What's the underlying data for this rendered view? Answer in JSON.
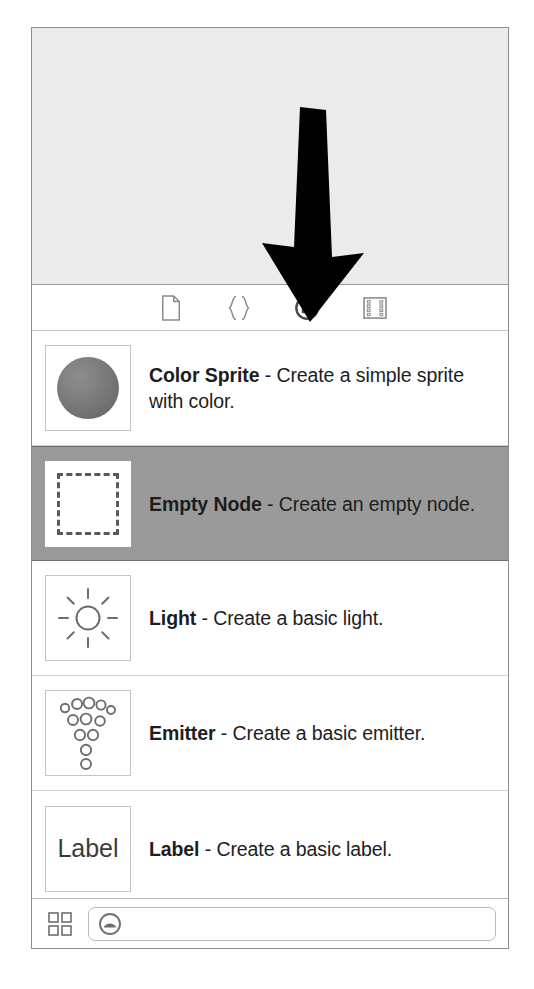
{
  "window": {
    "background_color": "#ffffff",
    "panel_border_color": "#8d8d8d"
  },
  "preview": {
    "name": "empty-preview-canvas",
    "background_color": "#ebebeb",
    "annotation": {
      "type": "arrow",
      "direction": "down",
      "color": "#000000",
      "points_to": "object-library-tab"
    }
  },
  "tabs": {
    "selected_index": 2,
    "items": [
      {
        "icon": "file-icon",
        "name": "tab-file",
        "label": ""
      },
      {
        "icon": "braces-icon",
        "name": "tab-code",
        "label": ""
      },
      {
        "icon": "object-icon",
        "name": "tab-objects",
        "label": ""
      },
      {
        "icon": "film-strip-icon",
        "name": "tab-media",
        "label": ""
      }
    ]
  },
  "node_list": {
    "selected_index": 1,
    "items": [
      {
        "title": "Color Sprite",
        "separator": " - ",
        "description": "Create a simple sprite with color.",
        "icon": "sphere-icon",
        "selected": false
      },
      {
        "title": "Empty Node",
        "separator": " - ",
        "description": "Create an empty node.",
        "icon": "dashed-square-icon",
        "selected": true
      },
      {
        "title": "Light",
        "separator": " - ",
        "description": "Create a basic light.",
        "icon": "light-icon",
        "selected": false
      },
      {
        "title": "Emitter",
        "separator": " - ",
        "description": "Create a basic emitter.",
        "icon": "emitter-icon",
        "selected": false
      },
      {
        "title": "Label",
        "separator": " - ",
        "description": "Create a basic label.",
        "icon": "label-icon",
        "icon_text": "Label",
        "selected": false
      }
    ]
  },
  "bottom_bar": {
    "grid_button_name": "grid-view-button",
    "filter": {
      "token_icon": "object-token-icon",
      "value": "",
      "placeholder": ""
    }
  },
  "colors": {
    "selection_gray": "#9a9a9a",
    "panel_gray": "#ebebeb",
    "text": "#1d1d1d",
    "icon_stroke": "#8a8a8a",
    "icon_stroke_selected": "#4a4a4a"
  }
}
